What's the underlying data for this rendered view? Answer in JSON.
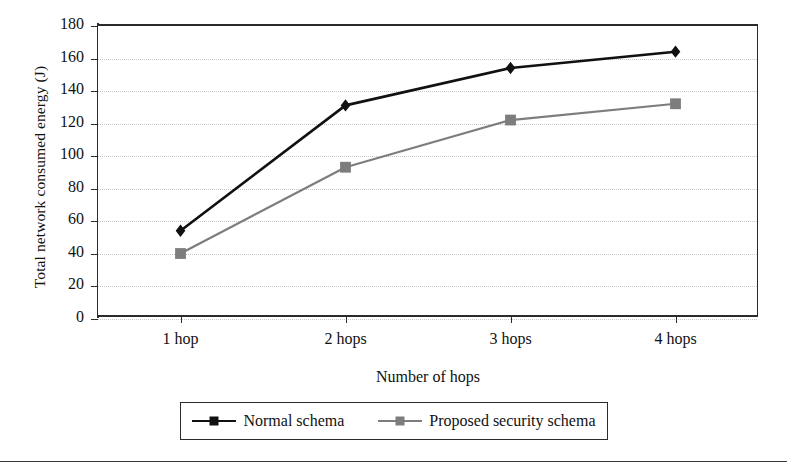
{
  "chart_data": {
    "type": "line",
    "title": "",
    "xlabel": "Number of hops",
    "ylabel": "Total network consumed energy (J)",
    "categories": [
      "1 hop",
      "2 hops",
      "3 hops",
      "4 hops"
    ],
    "series": [
      {
        "name": "Normal schema",
        "marker": "diamond",
        "color": "#111111",
        "values": [
          53,
          130,
          153,
          163
        ]
      },
      {
        "name": "Proposed security schema",
        "marker": "square",
        "color": "#7d7d7d",
        "values": [
          39,
          92,
          121,
          131
        ]
      }
    ],
    "ylim": [
      0,
      180
    ],
    "ytick_step": 20,
    "yticks": [
      0,
      20,
      40,
      60,
      80,
      100,
      120,
      140,
      160,
      180
    ],
    "grid": true,
    "legend_position": "below-plot"
  },
  "axes": {
    "y_title": "Total network consumed energy (J)",
    "x_title": "Number of hops",
    "y_tick_labels": [
      "180",
      "160",
      "140",
      "120",
      "100",
      "80",
      "60",
      "40",
      "20",
      "0"
    ],
    "x_tick_labels": [
      "1 hop",
      "2 hops",
      "3 hops",
      "4 hops"
    ]
  },
  "legend": {
    "entries": [
      {
        "label": "Normal schema",
        "marker": "diamond-marker-icon",
        "color": "#111111"
      },
      {
        "label": "Proposed security schema",
        "marker": "square-marker-icon",
        "color": "#7d7d7d"
      }
    ]
  },
  "colors": {
    "series_1": "#111111",
    "series_2": "#7d7d7d",
    "axis": "#2b2b2b",
    "grid": "#c9c9c9",
    "background": "#ffffff"
  }
}
